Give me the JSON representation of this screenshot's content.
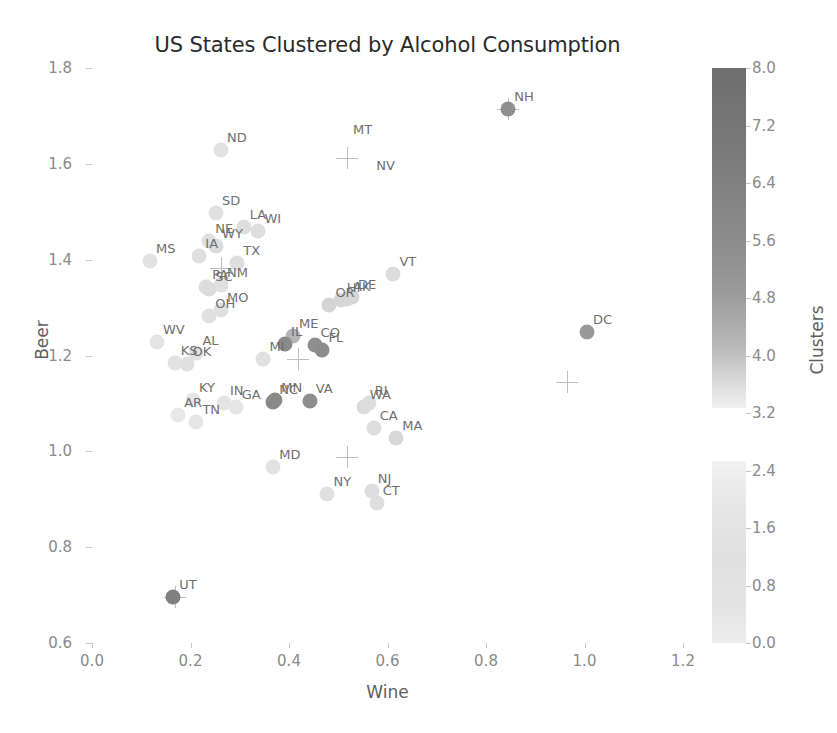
{
  "chart_data": {
    "type": "scatter",
    "title": "US States Clustered by Alcohol Consumption",
    "xlabel": "Wine",
    "ylabel": "Beer",
    "xlim": [
      -0.03,
      1.24
    ],
    "ylim": [
      0.58,
      1.83
    ],
    "xticks": [
      "0.0",
      "0.2",
      "0.4",
      "0.6",
      "0.8",
      "1.0",
      "1.2"
    ],
    "xtick_values": [
      0.0,
      0.2,
      0.4,
      0.6,
      0.8,
      1.0,
      1.2
    ],
    "yticks": [
      "0.6",
      "0.8",
      "1.0",
      "1.2",
      "1.4",
      "1.6",
      "1.8"
    ],
    "ytick_values": [
      0.6,
      0.8,
      1.0,
      1.2,
      1.4,
      1.6,
      1.8
    ],
    "grid": false,
    "legend": "none",
    "colorbar": {
      "label": "Clusters",
      "position": "right",
      "ticks": [
        "0.0",
        "0.8",
        "1.6",
        "2.4",
        "3.2",
        "4.0",
        "4.8",
        "5.6",
        "6.4",
        "7.2",
        "8.0"
      ],
      "tick_values": [
        0.0,
        0.8,
        1.6,
        2.4,
        3.2,
        4.0,
        4.8,
        5.6,
        6.4,
        7.2,
        8.0
      ],
      "vmin": 0.0,
      "vmax": 8.0,
      "cmap": "grayscale-dark-high"
    },
    "point_labels_shown": true,
    "points": [
      {
        "label": "NH",
        "x": 0.845,
        "y": 1.715,
        "cluster": 6,
        "color": "#8f8f8f"
      },
      {
        "label": "ND",
        "x": 0.262,
        "y": 1.628,
        "cluster": 1,
        "color": "#e2e2e2"
      },
      {
        "label": "SD",
        "x": 0.252,
        "y": 1.498,
        "cluster": 1,
        "color": "#e0e0e0"
      },
      {
        "label": "LA",
        "x": 0.308,
        "y": 1.468,
        "cluster": 1,
        "color": "#dedede"
      },
      {
        "label": "WI",
        "x": 0.338,
        "y": 1.46,
        "cluster": 1,
        "color": "#dedede"
      },
      {
        "label": "NE",
        "x": 0.238,
        "y": 1.438,
        "cluster": 1,
        "color": "#e0e0e0"
      },
      {
        "label": "WY",
        "x": 0.252,
        "y": 1.428,
        "cluster": 1,
        "color": "#dcdcdc"
      },
      {
        "label": "IA",
        "x": 0.218,
        "y": 1.408,
        "cluster": 1,
        "color": "#e0e0e0"
      },
      {
        "label": "MS",
        "x": 0.118,
        "y": 1.398,
        "cluster": 1,
        "color": "#e2e2e2"
      },
      {
        "label": "TX",
        "x": 0.295,
        "y": 1.393,
        "cluster": 1,
        "color": "#dedede"
      },
      {
        "label": "NM",
        "x": 0.262,
        "y": 1.348,
        "cluster": 1,
        "color": "#e0e0e0"
      },
      {
        "label": "PA",
        "x": 0.232,
        "y": 1.342,
        "cluster": 1,
        "color": "#dedede"
      },
      {
        "label": "SC",
        "x": 0.238,
        "y": 1.338,
        "cluster": 1,
        "color": "#dcdcdc"
      },
      {
        "label": "VT",
        "x": 0.612,
        "y": 1.37,
        "cluster": 1,
        "color": "#dcdcdc"
      },
      {
        "label": "MO",
        "x": 0.262,
        "y": 1.295,
        "cluster": 1,
        "color": "#e0e0e0"
      },
      {
        "label": "OH",
        "x": 0.238,
        "y": 1.282,
        "cluster": 1,
        "color": "#e0e0e0"
      },
      {
        "label": "DE",
        "x": 0.528,
        "y": 1.322,
        "cluster": 1,
        "color": "#d6d6d6"
      },
      {
        "label": "AK",
        "x": 0.518,
        "y": 1.318,
        "cluster": 1,
        "color": "#d8d8d8"
      },
      {
        "label": "HI",
        "x": 0.505,
        "y": 1.315,
        "cluster": 1,
        "color": "#d6d6d6"
      },
      {
        "label": "OR",
        "x": 0.482,
        "y": 1.305,
        "cluster": 1,
        "color": "#d4d4d4"
      },
      {
        "label": "DC",
        "x": 1.005,
        "y": 1.25,
        "cluster": 5,
        "color": "#999999"
      },
      {
        "label": "ME",
        "x": 0.408,
        "y": 1.24,
        "cluster": 3,
        "color": "#b5b5b5"
      },
      {
        "label": "CO",
        "x": 0.452,
        "y": 1.222,
        "cluster": 4,
        "color": "#8e8e8e"
      },
      {
        "label": "FL",
        "x": 0.468,
        "y": 1.212,
        "cluster": 4,
        "color": "#8c8c8c"
      },
      {
        "label": "IL",
        "x": 0.392,
        "y": 1.225,
        "cluster": 4,
        "color": "#8a8a8a"
      },
      {
        "label": "WV",
        "x": 0.132,
        "y": 1.228,
        "cluster": 1,
        "color": "#e4e4e4"
      },
      {
        "label": "AL",
        "x": 0.212,
        "y": 1.205,
        "cluster": 1,
        "color": "#e2e2e2"
      },
      {
        "label": "KS",
        "x": 0.168,
        "y": 1.185,
        "cluster": 1,
        "color": "#e2e2e2"
      },
      {
        "label": "OK",
        "x": 0.192,
        "y": 1.182,
        "cluster": 1,
        "color": "#e0e0e0"
      },
      {
        "label": "MI",
        "x": 0.348,
        "y": 1.192,
        "cluster": 1,
        "color": "#e0e0e0"
      },
      {
        "label": "NC",
        "x": 0.368,
        "y": 1.102,
        "cluster": 4,
        "color": "#888888"
      },
      {
        "label": "MN",
        "x": 0.372,
        "y": 1.108,
        "cluster": 4,
        "color": "#8a8a8a"
      },
      {
        "label": "VA",
        "x": 0.442,
        "y": 1.105,
        "cluster": 4,
        "color": "#8e8e8e"
      },
      {
        "label": "KY",
        "x": 0.205,
        "y": 1.108,
        "cluster": 1,
        "color": "#e6e6e6"
      },
      {
        "label": "IN",
        "x": 0.268,
        "y": 1.1,
        "cluster": 1,
        "color": "#e4e4e4"
      },
      {
        "label": "GA",
        "x": 0.292,
        "y": 1.092,
        "cluster": 1,
        "color": "#e6e6e6"
      },
      {
        "label": "AR",
        "x": 0.175,
        "y": 1.075,
        "cluster": 1,
        "color": "#e8e8e8"
      },
      {
        "label": "TN",
        "x": 0.212,
        "y": 1.062,
        "cluster": 1,
        "color": "#e6e6e6"
      },
      {
        "label": "RI",
        "x": 0.562,
        "y": 1.1,
        "cluster": 1,
        "color": "#dedede"
      },
      {
        "label": "WA",
        "x": 0.552,
        "y": 1.092,
        "cluster": 2,
        "color": "#dcdcdc"
      },
      {
        "label": "CA",
        "x": 0.572,
        "y": 1.048,
        "cluster": 1,
        "color": "#dedede"
      },
      {
        "label": "MA",
        "x": 0.618,
        "y": 1.028,
        "cluster": 1,
        "color": "#d8d8d8"
      },
      {
        "label": "MD",
        "x": 0.368,
        "y": 0.968,
        "cluster": 1,
        "color": "#e2e2e2"
      },
      {
        "label": "NY",
        "x": 0.478,
        "y": 0.912,
        "cluster": 1,
        "color": "#e0e0e0"
      },
      {
        "label": "NJ",
        "x": 0.568,
        "y": 0.918,
        "cluster": 1,
        "color": "#dedede"
      },
      {
        "label": "CT",
        "x": 0.578,
        "y": 0.892,
        "cluster": 1,
        "color": "#dedede"
      },
      {
        "label": "UT",
        "x": 0.165,
        "y": 0.695,
        "cluster": 7,
        "color": "#808080"
      }
    ],
    "label_only_markers": [
      {
        "label": "MT",
        "x": 0.518,
        "y": 1.672
      },
      {
        "label": "NV",
        "x": 0.565,
        "y": 1.598
      }
    ],
    "centroids": [
      {
        "x": 0.518,
        "y": 1.612
      },
      {
        "x": 0.262,
        "y": 1.382
      },
      {
        "x": 0.418,
        "y": 1.192
      },
      {
        "x": 0.965,
        "y": 1.145
      },
      {
        "x": 0.518,
        "y": 0.988
      },
      {
        "x": 0.168,
        "y": 0.695
      },
      {
        "x": 0.845,
        "y": 1.715
      }
    ]
  }
}
